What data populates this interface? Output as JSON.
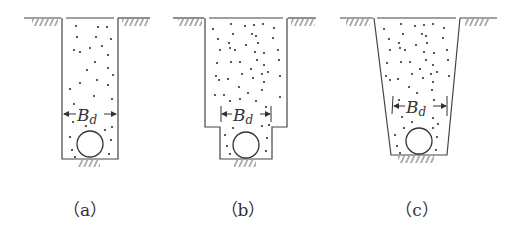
{
  "figure": {
    "panels": [
      {
        "id": "a",
        "caption": "（a）",
        "description": "Narrow rectangular trench with vertical walls",
        "width_label": "B",
        "width_label_sub": "d"
      },
      {
        "id": "b",
        "caption": "（b）",
        "description": "Stepped trench: wide upper section, narrow lower section around pipe",
        "width_label": "B",
        "width_label_sub": "d"
      },
      {
        "id": "c",
        "caption": "（c）",
        "description": "Trapezoidal trench with sloped walls",
        "width_label": "B",
        "width_label_sub": "d"
      }
    ],
    "colors": {
      "line": "#444444",
      "fill_dot": "#333333",
      "background": "#ffffff"
    }
  }
}
